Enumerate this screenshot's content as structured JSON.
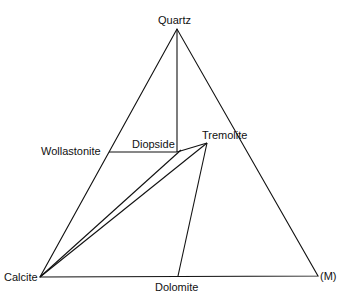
{
  "diagram": {
    "type": "ternary-phase-diagram",
    "vertices": {
      "top": "Quartz",
      "bottom_left": "Calcite",
      "bottom_right": "(M)"
    },
    "phases": {
      "wollastonite": "Wollastonite",
      "diopside": "Diopside",
      "tremolite": "Tremolite",
      "dolomite": "Dolomite"
    },
    "tie_lines": [
      [
        "Quartz",
        "Diopside"
      ],
      [
        "Wollastonite",
        "Diopside"
      ],
      [
        "Calcite",
        "Diopside"
      ],
      [
        "Calcite",
        "Tremolite"
      ],
      [
        "Diopside",
        "Tremolite"
      ],
      [
        "Tremolite",
        "Dolomite"
      ]
    ],
    "line_color": "#111111"
  }
}
